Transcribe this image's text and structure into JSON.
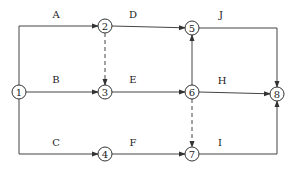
{
  "diagram": {
    "type": "activity-on-arrow network",
    "nodes": [
      {
        "id": "1",
        "label": "1",
        "x": 19,
        "y": 92
      },
      {
        "id": "2",
        "label": "2",
        "x": 105,
        "y": 26
      },
      {
        "id": "3",
        "label": "3",
        "x": 105,
        "y": 92
      },
      {
        "id": "4",
        "label": "4",
        "x": 105,
        "y": 154
      },
      {
        "id": "5",
        "label": "5",
        "x": 192,
        "y": 28
      },
      {
        "id": "6",
        "label": "6",
        "x": 192,
        "y": 92
      },
      {
        "id": "7",
        "label": "7",
        "x": 192,
        "y": 154
      },
      {
        "id": "8",
        "label": "8",
        "x": 277,
        "y": 94
      }
    ],
    "edges": [
      {
        "label": "A",
        "from": "1",
        "to": "2",
        "dashed": false
      },
      {
        "label": "B",
        "from": "1",
        "to": "3",
        "dashed": false
      },
      {
        "label": "C",
        "from": "1",
        "to": "4",
        "dashed": false
      },
      {
        "label": "D",
        "from": "2",
        "to": "5",
        "dashed": false
      },
      {
        "label": "",
        "from": "2",
        "to": "3",
        "dashed": true
      },
      {
        "label": "E",
        "from": "3",
        "to": "6",
        "dashed": false
      },
      {
        "label": "F",
        "from": "4",
        "to": "7",
        "dashed": false
      },
      {
        "label": "",
        "from": "6",
        "to": "5",
        "dashed": false
      },
      {
        "label": "H",
        "from": "6",
        "to": "8",
        "dashed": false
      },
      {
        "label": "",
        "from": "6",
        "to": "7",
        "dashed": true
      },
      {
        "label": "J",
        "from": "5",
        "to": "8",
        "dashed": false
      },
      {
        "label": "I",
        "from": "7",
        "to": "8",
        "dashed": false
      }
    ],
    "labels": {
      "A": "A",
      "B": "B",
      "C": "C",
      "D": "D",
      "E": "E",
      "F": "F",
      "H": "H",
      "I": "I",
      "J": "J"
    },
    "nodes_text": {
      "n1": "1",
      "n2": "2",
      "n3": "3",
      "n4": "4",
      "n5": "5",
      "n6": "6",
      "n7": "7",
      "n8": "8"
    }
  }
}
